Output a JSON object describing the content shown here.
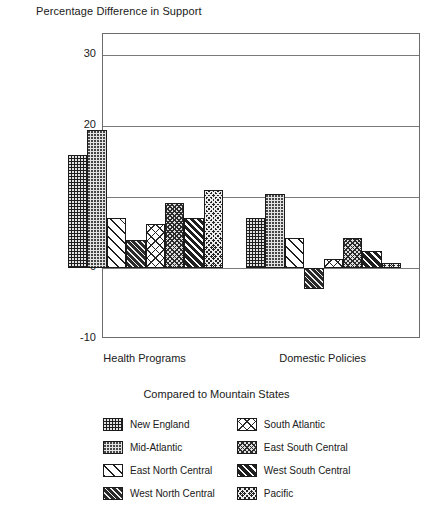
{
  "chart_data": {
    "type": "bar",
    "title": "Percentage Difference in Support",
    "subtitle": "Compared to Mountain States",
    "xlabel": "",
    "ylabel": "",
    "categories": [
      "Health Programs",
      "Domestic Policies"
    ],
    "ylim": [
      -10,
      33
    ],
    "yticks": [
      -10,
      0,
      10,
      20,
      30
    ],
    "ytick_labels": [
      "-10",
      "0",
      "10",
      "20",
      "30"
    ],
    "grid": true,
    "legend_position": "bottom",
    "series": [
      {
        "name": "New England",
        "values": [
          16.0,
          7.0
        ],
        "pattern": "dark-dotted",
        "swatch_class": "p-newengland"
      },
      {
        "name": "Mid-Atlantic",
        "values": [
          19.5,
          10.5
        ],
        "pattern": "light-dotted",
        "swatch_class": "p-midatlantic"
      },
      {
        "name": "East North Central",
        "values": [
          7.0,
          4.3
        ],
        "pattern": "white-diagonal",
        "swatch_class": "p-eastnorthcentral"
      },
      {
        "name": "West North Central",
        "values": [
          4.0,
          -3.0
        ],
        "pattern": "dark-diagonal",
        "swatch_class": "p-westnorthcentral"
      },
      {
        "name": "South Atlantic",
        "values": [
          6.2,
          1.3
        ],
        "pattern": "white-crosshatch",
        "swatch_class": "p-southatlantic"
      },
      {
        "name": "East South Central",
        "values": [
          9.2,
          4.3
        ],
        "pattern": "grey-checker",
        "swatch_class": "p-eastsouthcentral"
      },
      {
        "name": "West South Central",
        "values": [
          7.0,
          2.4
        ],
        "pattern": "bold-diagonal",
        "swatch_class": "p-westsouthcentral"
      },
      {
        "name": "Pacific",
        "values": [
          11.0,
          0.7
        ],
        "pattern": "dark-checker",
        "swatch_class": "p-pacific"
      }
    ]
  },
  "legend": {
    "title": "Compared to Mountain States"
  }
}
